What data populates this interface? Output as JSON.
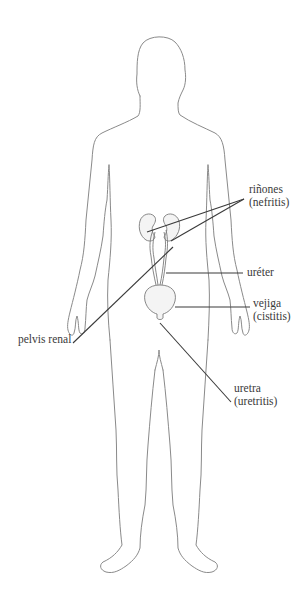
{
  "diagram": {
    "colors": {
      "outline": "#8a8a8a",
      "leader": "#3a3a3a",
      "organ_fill": "#f2f2f2",
      "text": "#3a3a3a"
    },
    "labels": {
      "kidneys": {
        "name": "riñones",
        "condition": "(nefritis)"
      },
      "ureter": {
        "name": "uréter"
      },
      "bladder": {
        "name": "vejiga",
        "condition": "(cistitis)"
      },
      "renal_pelvis": {
        "name": "pelvis renal"
      },
      "urethra": {
        "name": "uretra",
        "condition": "(uretritis)"
      }
    }
  }
}
